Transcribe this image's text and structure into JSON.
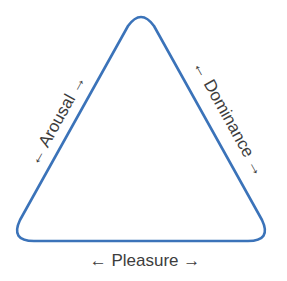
{
  "diagram": {
    "shape": "rounded-triangle",
    "stroke_color": "#3b73b9",
    "label_color": "#3d3d3d",
    "labels": {
      "left": "← Arousal →",
      "right": "← Dominance →",
      "bottom": "← Pleasure →"
    }
  }
}
